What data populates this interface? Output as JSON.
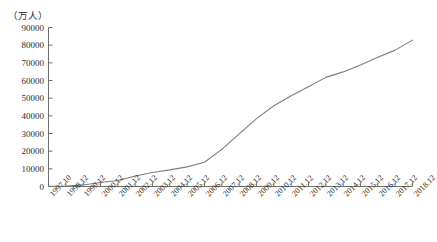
{
  "chart_data": {
    "type": "line",
    "title": "",
    "subtitle": "",
    "xlabel": "",
    "ylabel": "",
    "unit_label": "（万人）",
    "grid": false,
    "legend": false,
    "legend_position": "none",
    "line_color": "#7d7d7d",
    "axis_color": "#6e6e6e",
    "background": "#ffffff",
    "ylim": [
      0,
      90000
    ],
    "ytick_step": 10000,
    "yticks": [
      0,
      10000,
      20000,
      30000,
      40000,
      50000,
      60000,
      70000,
      80000,
      90000
    ],
    "categories": [
      "1997.10",
      "1998.12",
      "1999.12",
      "2000.12",
      "2001.12",
      "2002.12",
      "2003.12",
      "2004.12",
      "2005.12",
      "2006.12",
      "2007.12",
      "2008.12",
      "2009.12",
      "2010.12",
      "2011.12",
      "2012.12",
      "2013.12",
      "2014.12",
      "2015.12",
      "2016.12",
      "2017.12",
      "2018.12"
    ],
    "values": [
      62,
      210,
      890,
      2250,
      3370,
      5910,
      7950,
      9400,
      11100,
      13700,
      21000,
      29800,
      38400,
      45730,
      51310,
      56400,
      61758,
      64875,
      68826,
      73125,
      77198,
      82851
    ],
    "series": [
      {
        "name": "网民规模",
        "values": [
          62,
          210,
          890,
          2250,
          3370,
          5910,
          7950,
          9400,
          11100,
          13700,
          21000,
          29800,
          38400,
          45730,
          51310,
          56400,
          61758,
          64875,
          68826,
          73125,
          77198,
          82851
        ]
      }
    ]
  }
}
